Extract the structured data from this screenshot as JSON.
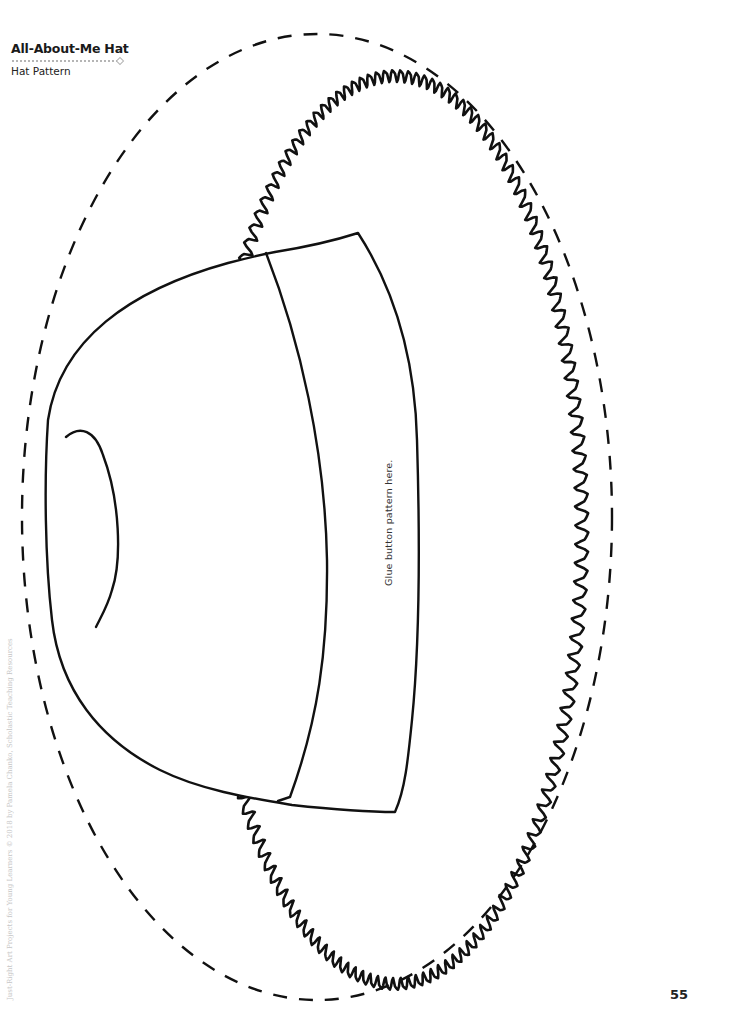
{
  "header": {
    "title": "All-About-Me Hat",
    "subtitle": "Hat Pattern"
  },
  "pattern": {
    "instruction": "Glue button pattern here.",
    "cut_line": "dashed-oval-cut-line",
    "pieces": [
      "hat-crown",
      "hat-band",
      "ruffled-brim"
    ]
  },
  "footer": {
    "page_number": "55",
    "credit": "Just-Right Art Projects for Young Learners © 2018 by Pamela Chanko, Scholastic Teaching Resources"
  },
  "colors": {
    "ink": "#111111",
    "paper": "#ffffff",
    "muted": "#c6c6c6"
  }
}
